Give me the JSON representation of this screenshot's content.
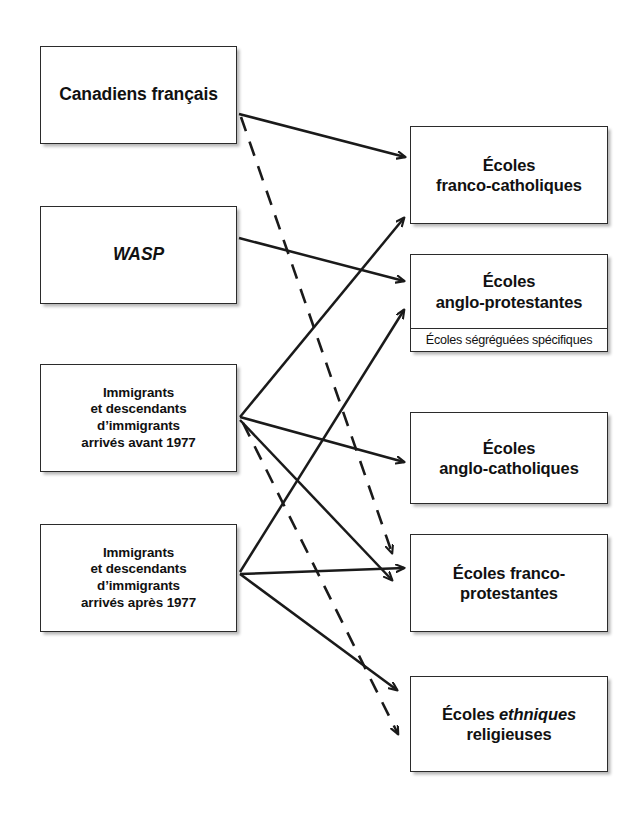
{
  "diagram": {
    "canvas": {
      "width": 638,
      "height": 834
    },
    "style": {
      "line_color": "#1a1a1a",
      "box_border_color": "#2b2b2b",
      "box_fill": "#ffffff",
      "page_background": "#ffffff"
    },
    "source_nodes": [
      {
        "id": "canadiens-francais",
        "lines": [
          "Canadiens français"
        ],
        "x": 40,
        "y": 46,
        "w": 197,
        "h": 98,
        "size": "label-lg",
        "style": "bold"
      },
      {
        "id": "wasp",
        "lines": [
          "WASP"
        ],
        "x": 40,
        "y": 206,
        "w": 197,
        "h": 98,
        "size": "label-lg",
        "style": "bold-italic"
      },
      {
        "id": "immigrants-avant-1977",
        "lines": [
          "Immigrants",
          "et descendants",
          "d’immigrants",
          "arrivés avant 1977"
        ],
        "x": 40,
        "y": 364,
        "w": 197,
        "h": 108,
        "size": "label-sm",
        "style": "bold"
      },
      {
        "id": "immigrants-apres-1977",
        "lines": [
          "Immigrants",
          "et descendants",
          "d’immigrants",
          "arrivés après 1977"
        ],
        "x": 40,
        "y": 524,
        "w": 197,
        "h": 108,
        "size": "label-sm",
        "style": "bold"
      }
    ],
    "target_nodes": [
      {
        "id": "ecoles-franco-catholiques",
        "lines": [
          "Écoles",
          "franco-catholiques"
        ],
        "x": 410,
        "y": 126,
        "w": 198,
        "h": 98,
        "size": "label-md",
        "style": "bold",
        "subtitle": null
      },
      {
        "id": "ecoles-anglo-protestantes",
        "lines": [
          "Écoles",
          "anglo-protestantes"
        ],
        "x": 410,
        "y": 254,
        "w": 198,
        "h": 98,
        "size": "label-md",
        "style": "bold",
        "subtitle": "Écoles ségréguées spécifiques"
      },
      {
        "id": "ecoles-anglo-catholiques",
        "lines": [
          "Écoles",
          "anglo-catholiques"
        ],
        "x": 410,
        "y": 412,
        "w": 198,
        "h": 92,
        "size": "label-md",
        "style": "bold",
        "subtitle": null
      },
      {
        "id": "ecoles-franco-protestantes",
        "lines": [
          "Écoles franco-",
          "protestantes"
        ],
        "x": 410,
        "y": 534,
        "w": 198,
        "h": 98,
        "size": "label-md",
        "style": "bold",
        "subtitle": null
      },
      {
        "id": "ecoles-ethniques-religieuses",
        "lines": [
          "Écoles ethniques",
          "religieuses"
        ],
        "x": 410,
        "y": 676,
        "w": 198,
        "h": 96,
        "size": "label-md",
        "style": "bold",
        "italic_words": [
          "ethniques"
        ],
        "subtitle": null
      }
    ],
    "edges": [
      {
        "id": "cf-to-franco-catholiques",
        "from": "canadiens-francais",
        "to": "ecoles-franco-catholiques",
        "line_style": "solid",
        "x1": 239,
        "y1": 114,
        "x2": 405,
        "y2": 157
      },
      {
        "id": "cf-to-franco-protestantes",
        "from": "canadiens-francais",
        "to": "ecoles-franco-protestantes",
        "line_style": "dashed",
        "x1": 241,
        "y1": 117,
        "x2": 392,
        "y2": 553
      },
      {
        "id": "wasp-to-anglo-protestantes",
        "from": "wasp",
        "to": "ecoles-anglo-protestantes",
        "line_style": "solid",
        "x1": 239,
        "y1": 238,
        "x2": 404,
        "y2": 281
      },
      {
        "id": "avant1977-to-franco-catholiques",
        "from": "immigrants-avant-1977",
        "to": "ecoles-franco-catholiques",
        "line_style": "solid",
        "x1": 240,
        "y1": 417,
        "x2": 404,
        "y2": 218
      },
      {
        "id": "avant1977-to-anglo-catholiques",
        "from": "immigrants-avant-1977",
        "to": "ecoles-anglo-catholiques",
        "line_style": "solid",
        "x1": 240,
        "y1": 417,
        "x2": 404,
        "y2": 462
      },
      {
        "id": "avant1977-to-franco-protestantes",
        "from": "immigrants-avant-1977",
        "to": "ecoles-franco-protestantes",
        "line_style": "solid",
        "x1": 240,
        "y1": 420,
        "x2": 392,
        "y2": 580
      },
      {
        "id": "avant1977-to-ethniques",
        "from": "immigrants-avant-1977",
        "to": "ecoles-ethniques-religieuses",
        "line_style": "dashed",
        "x1": 243,
        "y1": 423,
        "x2": 398,
        "y2": 734
      },
      {
        "id": "apres1977-to-anglo-protestantes",
        "from": "immigrants-apres-1977",
        "to": "ecoles-anglo-protestantes",
        "line_style": "solid",
        "x1": 240,
        "y1": 572,
        "x2": 404,
        "y2": 310
      },
      {
        "id": "apres1977-to-franco-protestantes",
        "from": "immigrants-apres-1977",
        "to": "ecoles-franco-protestantes",
        "line_style": "solid",
        "x1": 240,
        "y1": 574,
        "x2": 404,
        "y2": 568
      },
      {
        "id": "apres1977-to-ethniques",
        "from": "immigrants-apres-1977",
        "to": "ecoles-ethniques-religieuses",
        "line_style": "solid",
        "x1": 240,
        "y1": 574,
        "x2": 397,
        "y2": 690
      }
    ]
  }
}
